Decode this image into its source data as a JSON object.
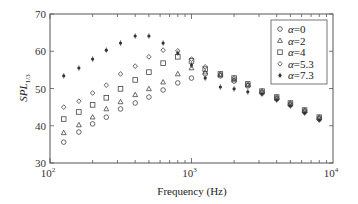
{
  "chart_data": {
    "type": "scatter",
    "title": "",
    "xlabel": "Frequency (Hz)",
    "ylabel": "SPL",
    "ylabel_subscript": "1/3",
    "xscale": "log",
    "xlim": [
      100,
      10000
    ],
    "ylim": [
      30,
      70
    ],
    "xticks": [
      100,
      1000,
      10000
    ],
    "xtick_labels": [
      {
        "base": "10",
        "exp": "2"
      },
      {
        "base": "10",
        "exp": "3"
      },
      {
        "base": "10",
        "exp": "4"
      }
    ],
    "yticks": [
      30,
      40,
      50,
      60,
      70
    ],
    "ytick_labels": [
      "30",
      "40",
      "50",
      "60",
      "70"
    ],
    "grid": false,
    "legend_position": "upper right",
    "x": [
      125,
      160,
      200,
      250,
      315,
      400,
      500,
      630,
      800,
      1000,
      1250,
      1600,
      2000,
      2500,
      3150,
      4000,
      5000,
      6300,
      8000
    ],
    "series": [
      {
        "name": "α = 0",
        "alpha": "0",
        "marker": "circle",
        "values": [
          35.6,
          38.3,
          40.5,
          42.3,
          44.5,
          46.1,
          47.7,
          49.6,
          51.5,
          52.8,
          53.9,
          53.4,
          52.0,
          50.7,
          48.8,
          47.2,
          45.6,
          43.7,
          41.8
        ]
      },
      {
        "name": "α = 2",
        "alpha": "2",
        "marker": "triangle",
        "values": [
          38.1,
          40.2,
          42.3,
          44.5,
          46.4,
          48.3,
          49.9,
          51.7,
          53.9,
          55.5,
          54.4,
          53.6,
          52.3,
          50.9,
          49.1,
          47.4,
          45.8,
          44.0,
          42.1
        ]
      },
      {
        "name": "α = 4",
        "alpha": "4",
        "marker": "square",
        "values": [
          41.8,
          43.7,
          45.6,
          47.5,
          49.9,
          52.3,
          54.4,
          56.8,
          58.5,
          57.4,
          55.2,
          53.9,
          52.8,
          51.2,
          49.3,
          47.7,
          46.1,
          44.2,
          42.3
        ]
      },
      {
        "name": "α = 5.3",
        "alpha": "5.3",
        "marker": "diamond",
        "values": [
          45.0,
          46.6,
          48.8,
          50.9,
          53.9,
          56.0,
          58.5,
          60.3,
          60.1,
          57.9,
          55.8,
          53.9,
          52.8,
          51.2,
          49.3,
          47.7,
          46.1,
          44.2,
          42.3
        ]
      },
      {
        "name": "α = 7.3",
        "alpha": "7.3",
        "marker": "star",
        "values": [
          53.4,
          55.5,
          57.9,
          60.3,
          62.2,
          64.1,
          64.1,
          62.2,
          59.5,
          56.3,
          52.8,
          50.4,
          49.9,
          49.1,
          48.5,
          46.9,
          45.3,
          43.4,
          41.5
        ]
      }
    ]
  },
  "legend": {
    "symbol": "α",
    "equals": "=",
    "items": [
      {
        "label": "0",
        "marker": "circle"
      },
      {
        "label": "2",
        "marker": "triangle"
      },
      {
        "label": "4",
        "marker": "square"
      },
      {
        "label": "5.3",
        "marker": "diamond"
      },
      {
        "label": "7.3",
        "marker": "star"
      }
    ]
  },
  "axis": {
    "x_label": "Frequency (Hz)",
    "y_label_main": "SPL",
    "y_label_sub": "1/3"
  },
  "colors": {
    "axis": "#555555",
    "marker": "#444444",
    "marker_fill_star": "#333333",
    "background": "#ffffff"
  }
}
